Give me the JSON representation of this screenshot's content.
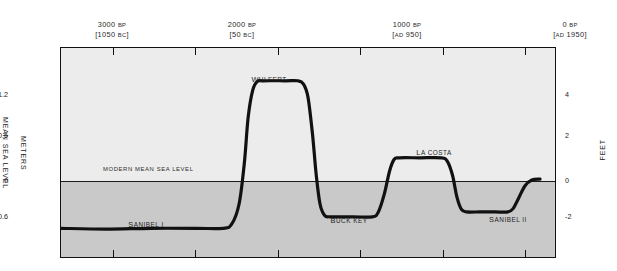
{
  "figure": {
    "top_caption_fragment": "",
    "background": "#ffffff",
    "plot_background": "#ececec",
    "sea_fill_color": "#c9c9c9",
    "curve_color": "#111111"
  },
  "axes": {
    "x": {
      "title": "",
      "labels": [
        {
          "primary": "3000",
          "unit": "BP",
          "secondary_open": "[1050 ",
          "secondary_unit": "BC",
          "secondary_close": "]",
          "bp": 3000
        },
        {
          "primary": "2000",
          "unit": "BP",
          "secondary_open": "[50 ",
          "secondary_unit": "BC",
          "secondary_close": "]",
          "bp": 2000
        },
        {
          "primary": "1000",
          "unit": "BP",
          "secondary_open": "[",
          "secondary_unit": "AD",
          "secondary_close": " 950]",
          "bp": 1000
        },
        {
          "primary": "0",
          "unit": "BP",
          "secondary_open": "[",
          "secondary_unit": "AD",
          "secondary_close": " 1950]",
          "bp": 0
        }
      ]
    },
    "y_left": {
      "title_line1": "MEAN SEA LEVEL",
      "title_line2": "METERS",
      "ticks": [
        "1.2",
        "0.6",
        "0",
        "-0.6"
      ],
      "values": [
        1.2,
        0.6,
        0,
        -0.6
      ],
      "unit": "meters"
    },
    "y_right": {
      "title": "FEET",
      "ticks": [
        "4",
        "2",
        "0",
        "-2"
      ],
      "values": [
        4,
        2,
        0,
        -2
      ],
      "unit": "feet"
    }
  },
  "annotations": {
    "modern_mean_sea_level": "MODERN MEAN SEA LEVEL"
  },
  "phases": [
    {
      "name_cap": "S",
      "name_rest": "ANIBEL I",
      "label": "SANIBEL I",
      "bp_center": 2700,
      "level_m": -0.6
    },
    {
      "name_cap": "W",
      "name_rest": "ULFERT",
      "label": "WULFERT",
      "bp_center": 1760,
      "level_m": 1.2
    },
    {
      "name_cap": "B",
      "name_rest": "UCK KEY",
      "label": "BUCK KEY",
      "bp_center": 1270,
      "level_m": -0.45
    },
    {
      "name_cap": "L",
      "name_rest": "A COSTA",
      "label": "LA COSTA",
      "bp_center": 800,
      "level_m": 0.26
    },
    {
      "name_cap": "S",
      "name_rest": "ANIBEL II",
      "label": "SANIBEL II",
      "bp_center": 310,
      "level_m": -0.4
    }
  ],
  "chart_data": {
    "type": "line",
    "title": "",
    "xlabel": "Years Before Present (BP) / Calendar date",
    "ylabel": "Mean sea level (meters)",
    "ylabel_secondary": "Mean sea level (feet)",
    "xlim": [
      3200,
      -100
    ],
    "x_direction": "decreasing_left_to_right",
    "ylim": [
      -0.95,
      1.6
    ],
    "ylim_feet": [
      -3.1,
      5.25
    ],
    "grid": false,
    "legend": false,
    "reference_lines": [
      {
        "y": 0,
        "label": "MODERN MEAN SEA LEVEL",
        "orientation": "horizontal"
      }
    ],
    "x_ticks_labeled": [
      3000,
      2000,
      1000,
      0
    ],
    "x_tick_secondary_labels": [
      "1050 BC",
      "50 BC",
      "AD 950",
      "AD 1950"
    ],
    "y_ticks_meters": [
      1.2,
      0.6,
      0,
      -0.6
    ],
    "y_ticks_feet": [
      4,
      2,
      0,
      -2
    ],
    "series": [
      {
        "name": "Southwest Florida relative sea-level curve",
        "x_unit": "years BP",
        "y_unit": "meters",
        "points": [
          {
            "bp": 3200,
            "m": -0.6
          },
          {
            "bp": 2900,
            "m": -0.61
          },
          {
            "bp": 2600,
            "m": -0.6
          },
          {
            "bp": 2300,
            "m": -0.6
          },
          {
            "bp": 2120,
            "m": -0.6
          },
          {
            "bp": 2060,
            "m": -0.55
          },
          {
            "bp": 2010,
            "m": -0.3
          },
          {
            "bp": 1975,
            "m": 0.2
          },
          {
            "bp": 1950,
            "m": 0.75
          },
          {
            "bp": 1920,
            "m": 1.08
          },
          {
            "bp": 1890,
            "m": 1.19
          },
          {
            "bp": 1850,
            "m": 1.2
          },
          {
            "bp": 1700,
            "m": 1.2
          },
          {
            "bp": 1620,
            "m": 1.2
          },
          {
            "bp": 1580,
            "m": 1.16
          },
          {
            "bp": 1550,
            "m": 1.0
          },
          {
            "bp": 1520,
            "m": 0.55
          },
          {
            "bp": 1495,
            "m": 0.05
          },
          {
            "bp": 1470,
            "m": -0.3
          },
          {
            "bp": 1440,
            "m": -0.44
          },
          {
            "bp": 1400,
            "m": -0.46
          },
          {
            "bp": 1250,
            "m": -0.46
          },
          {
            "bp": 1120,
            "m": -0.46
          },
          {
            "bp": 1080,
            "m": -0.4
          },
          {
            "bp": 1040,
            "m": -0.18
          },
          {
            "bp": 1005,
            "m": 0.1
          },
          {
            "bp": 975,
            "m": 0.24
          },
          {
            "bp": 940,
            "m": 0.26
          },
          {
            "bp": 800,
            "m": 0.26
          },
          {
            "bp": 660,
            "m": 0.26
          },
          {
            "bp": 620,
            "m": 0.22
          },
          {
            "bp": 585,
            "m": 0.05
          },
          {
            "bp": 555,
            "m": -0.22
          },
          {
            "bp": 525,
            "m": -0.37
          },
          {
            "bp": 490,
            "m": -0.4
          },
          {
            "bp": 400,
            "m": -0.4
          },
          {
            "bp": 300,
            "m": -0.4
          },
          {
            "bp": 215,
            "m": -0.4
          },
          {
            "bp": 180,
            "m": -0.36
          },
          {
            "bp": 140,
            "m": -0.22
          },
          {
            "bp": 100,
            "m": -0.08
          },
          {
            "bp": 55,
            "m": -0.01
          },
          {
            "bp": 0,
            "m": 0.0
          }
        ]
      }
    ],
    "annotations": [
      {
        "text": "WULFERT",
        "bp": 1760,
        "m": 1.2,
        "note": "high stand"
      },
      {
        "text": "LA COSTA",
        "bp": 800,
        "m": 0.26,
        "note": "high stand"
      },
      {
        "text": "SANIBEL I",
        "bp": 2700,
        "m": -0.6,
        "note": "low stand"
      },
      {
        "text": "BUCK KEY",
        "bp": 1270,
        "m": -0.46,
        "note": "low stand"
      },
      {
        "text": "SANIBEL II",
        "bp": 310,
        "m": -0.4,
        "note": "low stand"
      },
      {
        "text": "MODERN MEAN SEA LEVEL",
        "bp": 2640,
        "m": 0.0,
        "note": "datum line"
      }
    ]
  }
}
